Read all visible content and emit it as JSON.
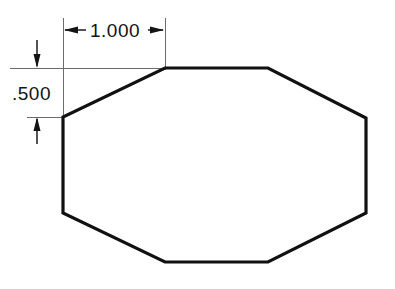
{
  "drawing": {
    "title": "Octagon chamfer dimension drawing",
    "background_color": "#ffffff",
    "line_color": "#111111",
    "dimension_line_color": "#5a5a5a",
    "part_outline": {
      "shape_name": "octagon",
      "stroke_width_px": 3.2,
      "vertices": [
        [
          165,
          68
        ],
        [
          268,
          68
        ],
        [
          366,
          118
        ],
        [
          366,
          213
        ],
        [
          268,
          262
        ],
        [
          165,
          262
        ],
        [
          63,
          213
        ],
        [
          63,
          117
        ]
      ]
    },
    "dimensions": [
      {
        "id": "horizontal-chamfer-width",
        "label": "1.000",
        "orientation": "horizontal",
        "value": 1.0,
        "text_x": 117,
        "text_y": 37,
        "dimension_line_y": 30,
        "from_x": 63,
        "to_x": 165,
        "arrow_direction": "outward",
        "extension_lines": [
          {
            "x": 63,
            "y1": 18,
            "y2": 119
          },
          {
            "x": 165,
            "y1": 18,
            "y2": 70
          }
        ]
      },
      {
        "id": "vertical-chamfer-height",
        "label": ".500",
        "orientation": "vertical",
        "value": 0.5,
        "text_x": 12,
        "text_y": 100,
        "dimension_line_x": 37,
        "from_y": 68,
        "to_y": 117,
        "arrow_direction": "inward",
        "extension_lines": [
          {
            "y": 68,
            "x1": 10,
            "x2": 165
          },
          {
            "y": 117,
            "x1": 27,
            "x2": 63
          }
        ]
      }
    ]
  }
}
